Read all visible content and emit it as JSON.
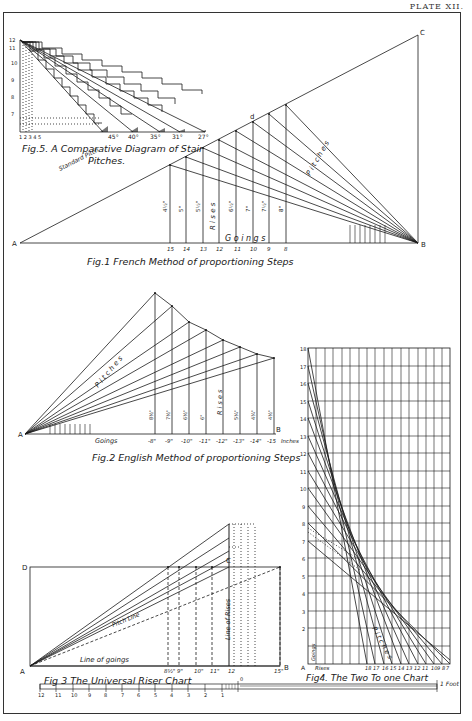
{
  "plate": {
    "label": "PLATE XII."
  },
  "fig1": {
    "caption": "Fig.1   French Method of proportioning Steps",
    "point_a": "A",
    "point_b": "B",
    "point_c": "C",
    "point_d": "d",
    "standard_pitch": "Standard Pitch",
    "goings_label": "G o i n g s",
    "rises_label": "R i s e s",
    "pitches_label": "P i t c h e s",
    "goings": [
      "15",
      "14",
      "13",
      "12",
      "11",
      "10",
      "9",
      "8"
    ],
    "rises": [
      "4½\"",
      "5\"",
      "5½\"",
      "6\"",
      "6½\"",
      "7\"",
      "7½\"",
      "8\""
    ]
  },
  "fig2": {
    "caption": "Fig.2   English Method of proportioning Steps",
    "point_a": "A",
    "point_b": "B",
    "goings_label": "Goings",
    "pitches_label": "P i t c h e s",
    "rises_label": "R i s e s",
    "goings": [
      "-8\"",
      "-9\"",
      "-10\"",
      "-11\"",
      "-12\"",
      "-13\"",
      "-14\"",
      "-15"
    ],
    "inches_label": "Inches",
    "rises": [
      "8½\"",
      "7½\"",
      "6½\"",
      "6\"",
      "5½\"",
      "5¼\"",
      "4¾\"",
      "4½\""
    ]
  },
  "fig3": {
    "caption": "Fig 3  The Universal Riser Chart",
    "point_a": "A",
    "point_b": "B",
    "point_c": "C",
    "point_d": "D",
    "pitch_line": "Pitch Line",
    "line_of_goings": "Line of goings",
    "line_of_rises": "Line of Rises",
    "goings": [
      "8½\"",
      "9\"",
      "10\"",
      "11\"",
      "12",
      "15\""
    ]
  },
  "fig4": {
    "caption": "Fig4. The Two To one Chart",
    "point_a": "A",
    "rises_label": "Rises",
    "goings_label": "Goings",
    "pitches_label": "P i t c h e s",
    "y_ticks": [
      "18",
      "17",
      "16",
      "15",
      "14",
      "13",
      "12",
      "11",
      "10",
      "9",
      "8",
      "7",
      "6",
      "5",
      "4",
      "3",
      "2",
      "1"
    ],
    "x_ticks": [
      "1",
      "2",
      "3",
      "4",
      "5",
      "18",
      "17",
      "16",
      "15",
      "14",
      "13",
      "12",
      "11",
      "10",
      "9",
      "8",
      "7"
    ]
  },
  "fig5": {
    "caption_line1": "Fig.5. A Comparative Diagram of Stair",
    "caption_line2": "Pitches.",
    "angles": [
      "45°",
      "40°",
      "35°",
      "31°",
      "27°"
    ],
    "x_ticks": [
      "1",
      "2",
      "3",
      "4",
      "5"
    ]
  },
  "scale": {
    "ticks": [
      "12",
      "11",
      "10",
      "9",
      "8",
      "7",
      "6",
      "5",
      "4",
      "3",
      "2",
      "1",
      "0"
    ],
    "unit": "1 Foot"
  }
}
